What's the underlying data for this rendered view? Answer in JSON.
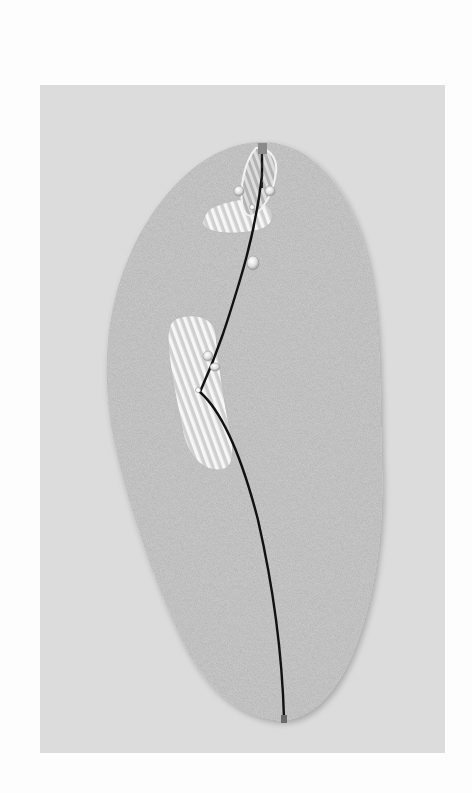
{
  "diagram": {
    "type": "golf-hole-layout",
    "colors": {
      "page_background": "#fdfdfd",
      "panel_background": "#dcdcdc",
      "rough": "#c4c4c4",
      "hazard_fill": "#d2d2d2",
      "hazard_stripe": "#f4f4f4",
      "green_stripe": "#a8a8a8",
      "shot_path": "#111111",
      "pin": "#8a8a8a",
      "tee": "#707070",
      "marker": "#e2e2e2"
    },
    "elements": {
      "rough_area": "rough-outline",
      "green": "putting-green",
      "hazard_upper": "hazard-near-green",
      "hazard_mid": "fairway-hazard",
      "pin": "flag-pin",
      "tee": "tee-box",
      "shot_path": "shot-trajectory",
      "markers": [
        "marker-left-green",
        "marker-right-green",
        "marker-upper-fairway",
        "marker-mid-1",
        "marker-mid-2",
        "marker-landing"
      ]
    }
  }
}
